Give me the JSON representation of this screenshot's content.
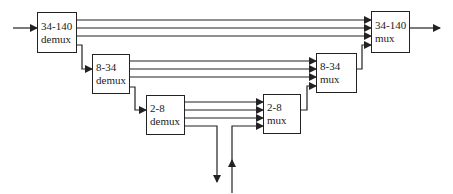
{
  "diagram": {
    "title": "",
    "line_color": "#222222",
    "boxes": [
      {
        "id": "demux-34-140",
        "line1": "34-140",
        "line2": "demux",
        "x": 37,
        "y": 12,
        "w": 40,
        "h": 41
      },
      {
        "id": "demux-8-34",
        "line1": "8-34",
        "line2": "demux",
        "x": 92,
        "y": 54,
        "w": 38,
        "h": 40
      },
      {
        "id": "demux-2-8",
        "line1": "2-8",
        "line2": "demux",
        "x": 146,
        "y": 95,
        "w": 39,
        "h": 40
      },
      {
        "id": "mux-2-8",
        "line1": "2-8",
        "line2": "mux",
        "x": 263,
        "y": 94,
        "w": 38,
        "h": 40
      },
      {
        "id": "mux-8-34",
        "line1": "8-34",
        "line2": "mux",
        "x": 316,
        "y": 53,
        "w": 41,
        "h": 40
      },
      {
        "id": "mux-34-140",
        "line1": "34-140",
        "line2": "mux",
        "x": 371,
        "y": 11,
        "w": 39,
        "h": 42
      }
    ],
    "edges": [
      {
        "from": "input",
        "to": "demux-34-140"
      },
      {
        "from": "demux-34-140",
        "to": "mux-34-140",
        "count": 3
      },
      {
        "from": "demux-34-140",
        "to": "demux-8-34"
      },
      {
        "from": "demux-8-34",
        "to": "mux-8-34",
        "count": 3
      },
      {
        "from": "demux-8-34",
        "to": "demux-2-8"
      },
      {
        "from": "demux-2-8",
        "to": "mux-2-8",
        "count": 3
      },
      {
        "from": "demux-2-8",
        "to": "drop-output"
      },
      {
        "from": "add-input",
        "to": "mux-2-8"
      },
      {
        "from": "mux-2-8",
        "to": "mux-8-34"
      },
      {
        "from": "mux-8-34",
        "to": "mux-34-140"
      },
      {
        "from": "mux-34-140",
        "to": "output"
      }
    ]
  }
}
